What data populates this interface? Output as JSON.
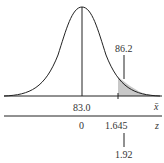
{
  "diagram": {
    "type": "normal-distribution",
    "xbar_axis": {
      "label": "x̄",
      "mean_label": "83.0",
      "critical_label": "86.2"
    },
    "z_axis": {
      "label": "z",
      "zero_label": "0",
      "critical_label": "1.645",
      "observed_label": "1.92"
    },
    "colors": {
      "curve": "#222222",
      "shade": "#c8c8c8",
      "axis": "#222222"
    }
  }
}
